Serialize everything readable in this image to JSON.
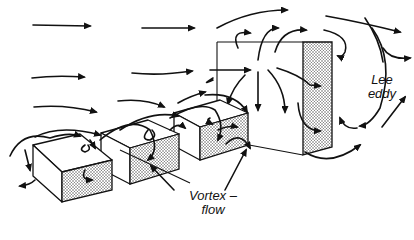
{
  "labels": {
    "lee_line1": "Lee",
    "lee_line2": "eddy",
    "vortex_line1": "Vortex –",
    "vortex_line2": "flow"
  },
  "colors": {
    "ink": "#111111",
    "background": "#ffffff",
    "shading": "#9a9a9a"
  }
}
